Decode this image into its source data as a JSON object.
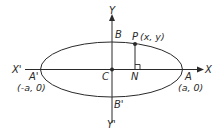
{
  "diagram": {
    "type": "ellipse-geometry",
    "colors": {
      "stroke": "#2a2a2a",
      "background": "#ffffff"
    },
    "labels": {
      "y_axis_top": "Y",
      "y_axis_bottom": "Y'",
      "x_axis_left": "X'",
      "x_axis_right": "X",
      "vertex_top": "B",
      "vertex_bottom": "B'",
      "vertex_left": "A'",
      "vertex_right": "A",
      "center": "C",
      "foot": "N",
      "point": "P",
      "point_coords": "(x, y)",
      "vertex_left_coords": "(-a, 0)",
      "vertex_right_coords": "(a, 0)"
    }
  }
}
